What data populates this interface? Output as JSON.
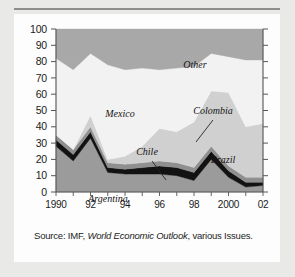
{
  "figure": {
    "source_prefix": "Source: IMF, ",
    "source_italic": "World Economic Outlook",
    "source_suffix": ", various Issues."
  },
  "chart_data": {
    "type": "area",
    "stacked": true,
    "title": "",
    "xlabel": "",
    "ylabel": "",
    "ylim": [
      0,
      100
    ],
    "yticks": [
      0,
      10,
      20,
      30,
      40,
      50,
      60,
      70,
      80,
      90,
      100
    ],
    "ytick_labels": [
      "0",
      "10",
      "20",
      "30",
      "40",
      "50",
      "60",
      "70",
      "80",
      "90",
      "100"
    ],
    "grid": false,
    "legend": "inline-annotations",
    "x": [
      1990,
      1991,
      1992,
      1993,
      1994,
      1995,
      1996,
      1997,
      1998,
      1999,
      2000,
      2001,
      2002
    ],
    "xtick_labels": [
      "1990",
      "",
      "92",
      "",
      "94",
      "",
      "96",
      "",
      "98",
      "",
      "2000",
      "",
      "02"
    ],
    "series": [
      {
        "name": "Argentina",
        "color": "#9b9b9b",
        "values": [
          28,
          19,
          33,
          12,
          11,
          11,
          11,
          10,
          7,
          20,
          9,
          3,
          4
        ]
      },
      {
        "name": "Chile",
        "color": "#121212",
        "values": [
          4,
          4,
          4,
          3,
          3,
          4,
          5,
          5,
          5,
          5,
          4,
          3,
          2
        ]
      },
      {
        "name": "Colombia",
        "color": "#8f8f8f",
        "values": [
          3,
          3,
          3,
          3,
          3,
          3,
          3,
          3,
          3,
          3,
          3,
          3,
          3
        ]
      },
      {
        "name": "Brazil",
        "color": "#d0d0d0",
        "values": [
          0,
          0,
          7,
          2,
          5,
          10,
          20,
          19,
          28,
          34,
          45,
          31,
          33
        ]
      },
      {
        "name": "Mexico",
        "color": "#f2f2f2",
        "values": [
          47,
          49,
          38,
          58,
          53,
          48,
          36,
          39,
          34,
          23,
          22,
          41,
          39
        ]
      },
      {
        "name": "Other",
        "color": "#a8a8a8",
        "values": [
          18,
          25,
          15,
          22,
          25,
          24,
          25,
          24,
          23,
          15,
          17,
          19,
          19
        ]
      }
    ],
    "annotations": [
      {
        "text": "Other",
        "x": 175,
        "y": 48
      },
      {
        "text": "Mexico",
        "x": 100,
        "y": 97
      },
      {
        "text": "Colombia",
        "x": 193,
        "y": 94
      },
      {
        "text": "Chile",
        "x": 127,
        "y": 135
      },
      {
        "text": "Brazil",
        "x": 203,
        "y": 143
      },
      {
        "text": "Argentina",
        "x": 88,
        "y": 182
      }
    ]
  }
}
